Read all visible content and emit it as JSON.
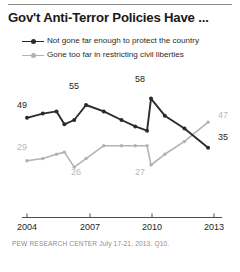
{
  "title": "Gov't Anti-Terror Policies Have ...",
  "legend": {
    "items": [
      {
        "label": "Not gone far enough to protect the country",
        "color": "#2b2b2b",
        "key": "not_far_enough"
      },
      {
        "label": "Gone too far in restricting civil liberties",
        "color": "#b3b3b3",
        "key": "too_far"
      }
    ]
  },
  "source": "PEW RESEARCH CENTER July 17-21, 2013. Q10.",
  "axis": {
    "ticks": [
      "2004",
      "2007",
      "2010",
      "2013"
    ]
  },
  "point_labels": {
    "dark_start": "49",
    "dark_peak_2007": "55",
    "dark_peak_2010": "58",
    "dark_end": "35",
    "light_start": "29",
    "light_min_2006": "26",
    "light_min_2010": "27",
    "light_end": "47"
  },
  "chart_data": {
    "type": "line",
    "title": "Gov't Anti-Terror Policies Have ...",
    "xlabel": "",
    "ylabel": "",
    "grid": false,
    "legend_position": "top",
    "xlim": [
      2004,
      2013.5
    ],
    "ylim": [
      20,
      62
    ],
    "xticks": [
      2004,
      2007,
      2010,
      2013
    ],
    "annotations": [
      {
        "series": "Not gone far enough to protect the country",
        "x": 2004.0,
        "y": 49,
        "text": "49",
        "position": "left"
      },
      {
        "series": "Not gone far enough to protect the country",
        "x": 2007.0,
        "y": 55,
        "text": "55",
        "position": "above"
      },
      {
        "series": "Not gone far enough to protect the country",
        "x": 2010.3,
        "y": 58,
        "text": "58",
        "position": "above"
      },
      {
        "series": "Not gone far enough to protect the country",
        "x": 2013.2,
        "y": 35,
        "text": "35",
        "position": "right"
      },
      {
        "series": "Gone too far in restricting civil liberties",
        "x": 2004.0,
        "y": 29,
        "text": "29",
        "position": "left"
      },
      {
        "series": "Gone too far in restricting civil liberties",
        "x": 2006.4,
        "y": 26,
        "text": "26",
        "position": "below"
      },
      {
        "series": "Gone too far in restricting civil liberties",
        "x": 2010.3,
        "y": 27,
        "text": "27",
        "position": "below"
      },
      {
        "series": "Gone too far in restricting civil liberties",
        "x": 2013.2,
        "y": 47,
        "text": "47",
        "position": "right"
      }
    ],
    "series": [
      {
        "name": "Not gone far enough to protect the country",
        "color": "#2b2b2b",
        "x": [
          2004.0,
          2004.8,
          2005.5,
          2005.9,
          2006.4,
          2007.0,
          2007.9,
          2008.8,
          2009.5,
          2010.1,
          2010.3,
          2011.0,
          2012.0,
          2013.2
        ],
        "values": [
          49,
          51,
          52,
          46,
          48,
          55,
          52,
          48,
          45,
          43,
          58,
          50,
          44,
          35
        ]
      },
      {
        "name": "Gone too far in restricting civil liberties",
        "color": "#b3b3b3",
        "x": [
          2004.0,
          2004.8,
          2005.5,
          2005.9,
          2006.4,
          2007.0,
          2007.9,
          2008.8,
          2009.5,
          2010.1,
          2010.3,
          2011.0,
          2012.0,
          2013.2
        ],
        "values": [
          29,
          30,
          32,
          33,
          26,
          30,
          36,
          36,
          36,
          36,
          27,
          32,
          38,
          47
        ]
      }
    ]
  }
}
